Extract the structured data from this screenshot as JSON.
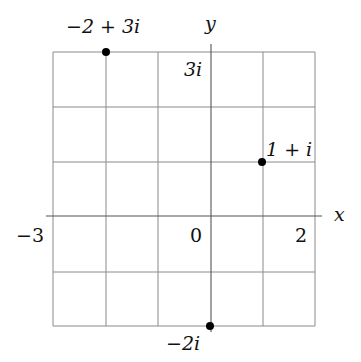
{
  "diagram": {
    "axes": {
      "x_label": "x",
      "y_label": "y",
      "x_range": [
        -3,
        2
      ],
      "y_range": [
        -2,
        3
      ]
    },
    "tick_labels": {
      "x_min": "−3",
      "origin": "0",
      "x_max": "2",
      "y_max": "3i"
    },
    "points": [
      {
        "re": -2,
        "im": 3,
        "label": "−2 + 3i"
      },
      {
        "re": 1,
        "im": 1,
        "label": "1 + i"
      },
      {
        "re": 0,
        "im": -2,
        "label": "−2i"
      }
    ],
    "colors": {
      "grid": "#8a8a8a",
      "axis": "#555555",
      "point": "#000000",
      "text": "#111111"
    }
  }
}
